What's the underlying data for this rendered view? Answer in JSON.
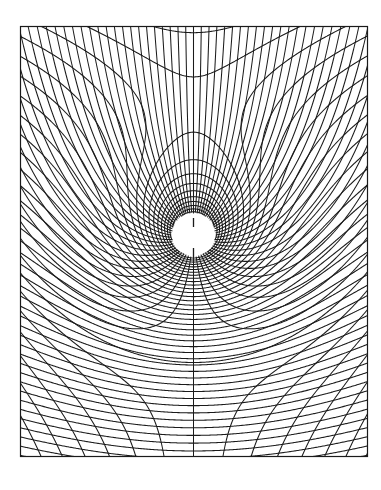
{
  "figure": {
    "title": "Orthogonal flow-net grid around a circular body (uniform flow + source)",
    "canvas": {
      "width": 381,
      "height": 490,
      "background": "#ffffff",
      "ink": "#1a1a1a"
    },
    "frame": {
      "left": 20,
      "top": 26,
      "right": 368,
      "bottom": 457
    },
    "body_circle": {
      "cx": 193.5,
      "cy": 234.5,
      "r": 21.5
    },
    "flow_model": {
      "uniform_flow_direction": "down",
      "source_strength_d_px": 128,
      "stagnation_point": {
        "x": 193.5,
        "y": 106.5
      },
      "grid_lines_around_source": 64
    },
    "internal_spokes": [
      {
        "x": 193.5,
        "y1": 218,
        "y2": 227
      },
      {
        "x": 193.5,
        "y1": 248,
        "y2": 257
      }
    ]
  }
}
